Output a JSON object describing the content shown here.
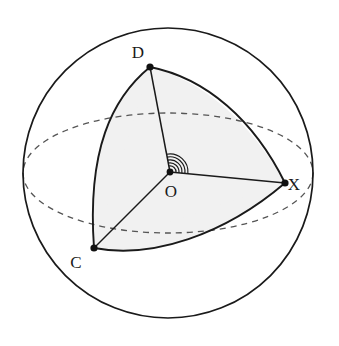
{
  "figure": {
    "background_color": "#ffffff",
    "stroke_color": "#1a1a1a",
    "shade_color": "#f1f1f1",
    "dashed_color": "#555555"
  },
  "sphere": {
    "name": "outer-sphere",
    "center": {
      "x": 168,
      "y": 173
    },
    "radius": 145,
    "stroke_width": 1.6
  },
  "equator": {
    "name": "equator-ellipse",
    "center": {
      "x": 168,
      "y": 173
    },
    "rx": 145,
    "ry": 60,
    "dash_pattern": "6 5",
    "stroke_width": 1.3
  },
  "vertices": [
    {
      "id": "D",
      "label": "D",
      "point": {
        "x": 150,
        "y": 67
      },
      "label_pos": {
        "x": 138,
        "y": 56
      }
    },
    {
      "id": "X",
      "label": "X",
      "point": {
        "x": 285,
        "y": 183
      },
      "label_pos": {
        "x": 292,
        "y": 190
      }
    },
    {
      "id": "C",
      "label": "C",
      "point": {
        "x": 94,
        "y": 248
      },
      "label_pos": {
        "x": 75,
        "y": 266
      }
    },
    {
      "id": "O",
      "label": "O",
      "point": {
        "x": 170,
        "y": 172
      },
      "label_pos": {
        "x": 167,
        "y": 196
      }
    }
  ],
  "surface_arcs": [
    {
      "id": "arc-DC",
      "from": "D",
      "to": "C",
      "note": "great-circle arc bulging left"
    },
    {
      "id": "arc-DX",
      "from": "D",
      "to": "X",
      "note": "great-circle arc bulging up-right"
    },
    {
      "id": "arc-CX",
      "from": "C",
      "to": "X",
      "note": "great-circle arc bulging down"
    }
  ],
  "radii": [
    {
      "id": "radius-OD",
      "from": "O",
      "to": "D"
    },
    {
      "id": "radius-OX",
      "from": "O",
      "to": "X"
    },
    {
      "id": "radius-OC",
      "from": "O",
      "to": "C"
    }
  ],
  "solid_angle_marker": {
    "name": "solid-angle-arcs-at-O",
    "arc_count": 5,
    "radii_px": [
      6,
      9,
      12,
      15,
      18
    ],
    "note": "nested arcs between OD and OX marking the solid angle at the centre"
  },
  "point_marker": {
    "radius": 3.4,
    "fill": "#111111"
  }
}
